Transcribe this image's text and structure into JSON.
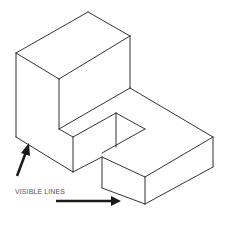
{
  "figure": {
    "annotation_label": "VISIBLE LINES",
    "line_color": "#333333",
    "arrow_color": "#1a1a1a",
    "background": "#ffffff"
  },
  "shape": {
    "edges": [
      [
        16,
        53,
        88,
        12
      ],
      [
        88,
        12,
        130,
        36
      ],
      [
        130,
        36,
        59,
        79
      ],
      [
        59,
        79,
        16,
        53
      ],
      [
        16,
        53,
        16,
        137
      ],
      [
        59,
        79,
        59,
        129
      ],
      [
        130,
        36,
        130,
        88
      ],
      [
        59,
        129,
        130,
        88
      ],
      [
        59,
        129,
        73,
        137
      ],
      [
        73,
        137,
        116,
        113
      ],
      [
        73,
        137,
        73,
        172
      ],
      [
        16,
        137,
        73,
        172
      ],
      [
        73,
        172,
        102,
        157
      ],
      [
        116,
        113,
        145,
        129
      ],
      [
        145,
        129,
        102,
        153
      ],
      [
        116,
        113,
        116,
        147
      ],
      [
        130,
        88,
        213,
        137
      ],
      [
        213,
        137,
        213,
        167
      ],
      [
        213,
        167,
        145,
        204
      ],
      [
        145,
        204,
        145,
        177
      ],
      [
        145,
        177,
        213,
        137
      ],
      [
        102,
        157,
        145,
        177
      ],
      [
        102,
        157,
        102,
        188
      ],
      [
        102,
        188,
        145,
        204
      ]
    ]
  }
}
